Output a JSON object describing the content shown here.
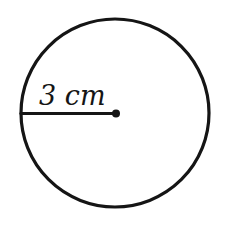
{
  "diagram": {
    "type": "circle-with-radius",
    "radius_label": "3 cm",
    "stroke_color": "#151515",
    "background_color": "#ffffff"
  }
}
